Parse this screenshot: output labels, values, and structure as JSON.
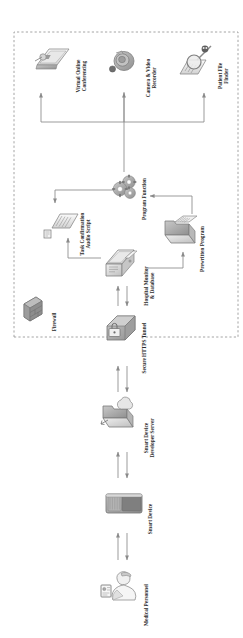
{
  "diagram": {
    "orientation": "rotated-90",
    "boundary": {
      "name": "hospital-network-boundary",
      "style": "dashed"
    },
    "nodes": [
      {
        "id": "medical-personnel",
        "label": "Medical Personnel",
        "icon": "person-with-badge-icon"
      },
      {
        "id": "smart-device",
        "label": "Smart Device",
        "icon": "smart-speaker-icon"
      },
      {
        "id": "developer-server",
        "label": "Smart Device\nDeveloper Server",
        "icon": "server-cloud-icon"
      },
      {
        "id": "https-tunnel",
        "label": "Secure HTTPS Tunnel",
        "icon": "lock-router-icon"
      },
      {
        "id": "firewall",
        "label": "Firewall",
        "icon": "brick-wall-icon"
      },
      {
        "id": "hospital-monitor",
        "label": "Hospital Monitor\n& Database",
        "icon": "desktop-database-icon"
      },
      {
        "id": "audio-script",
        "label": "Task Confirmation\nAudio Script",
        "icon": "script-document-icon"
      },
      {
        "id": "program-function",
        "label": "Program Function",
        "icon": "gears-icon"
      },
      {
        "id": "prewritten-program",
        "label": "Prewritten Program",
        "icon": "folder-program-icon"
      },
      {
        "id": "virtual-conferencing",
        "label": "Virtual Online\nConferencing",
        "icon": "video-call-screen-icon"
      },
      {
        "id": "camera-recorder",
        "label": "Camera & Video\nRecorder",
        "icon": "camera-icon"
      },
      {
        "id": "file-finder",
        "label": "Patient File\nFinder",
        "icon": "magnifier-documents-icon"
      }
    ],
    "edges": [
      {
        "from": "medical-personnel",
        "to": "smart-device",
        "direction": "bidirectional"
      },
      {
        "from": "smart-device",
        "to": "developer-server",
        "direction": "bidirectional"
      },
      {
        "from": "developer-server",
        "to": "https-tunnel",
        "direction": "bidirectional"
      },
      {
        "from": "https-tunnel",
        "to": "hospital-monitor",
        "direction": "bidirectional"
      },
      {
        "from": "hospital-monitor",
        "to": "audio-script",
        "direction": "forward"
      },
      {
        "from": "program-function",
        "to": "audio-script",
        "direction": "forward"
      },
      {
        "from": "prewritten-program",
        "to": "program-function",
        "direction": "forward"
      },
      {
        "from": "hospital-monitor",
        "to": "prewritten-program",
        "direction": "forward"
      },
      {
        "from": "program-function",
        "to": "virtual-conferencing",
        "direction": "forward"
      },
      {
        "from": "program-function",
        "to": "camera-recorder",
        "direction": "forward"
      },
      {
        "from": "program-function",
        "to": "file-finder",
        "direction": "forward"
      }
    ],
    "colors": {
      "background": "#ffffff",
      "line": "#7e7e7e",
      "text": "#2b2b2b",
      "icon_fill": "#d9d9d9",
      "icon_stroke": "#8a8a8a",
      "boundary": "#8f8f8f"
    }
  }
}
